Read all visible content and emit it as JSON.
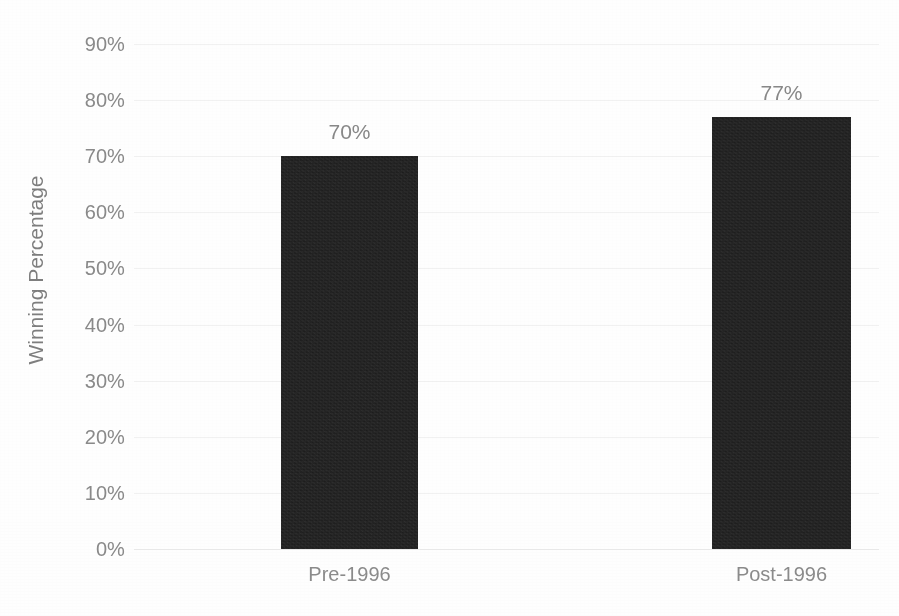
{
  "chart_data": {
    "type": "bar",
    "title": "",
    "subtitle": "",
    "xlabel": "",
    "ylabel": "Winning Percentage",
    "categories": [
      "Pre-1996",
      "Post-1996"
    ],
    "values": [
      70,
      77
    ],
    "data_labels": [
      "70%",
      "77%"
    ],
    "ylim": [
      0,
      90
    ],
    "ytick_values": [
      90,
      80,
      70,
      60,
      50,
      40,
      30,
      20,
      10,
      0
    ],
    "ytick_labels": [
      "90%",
      "80%",
      "70%",
      "60%",
      "50%",
      "40%",
      "30%",
      "20%",
      "10%",
      "0%"
    ],
    "grid": true,
    "legend": "none",
    "bar_color": "#1d1d1d",
    "gridline_color": "#f1f1f1",
    "label_color": "#8a8a8a",
    "background_color": "#fefefe"
  },
  "axis": {
    "y_title": "Winning Percentage"
  }
}
